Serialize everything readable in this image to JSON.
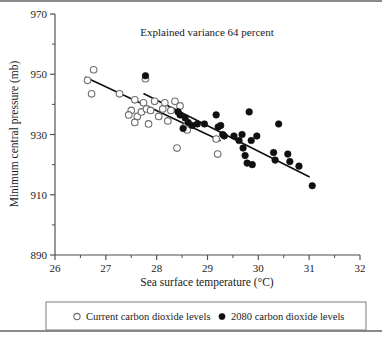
{
  "chart_data": {
    "type": "scatter",
    "title": "Explained variance 64 percent",
    "xlabel": "Sea surface temperature (°C)",
    "ylabel": "Minimum central pressure (mb)",
    "xlim": [
      26,
      32
    ],
    "ylim": [
      890,
      970
    ],
    "xticks": [
      26,
      27,
      28,
      29,
      30,
      31,
      32
    ],
    "yticks": [
      890,
      910,
      930,
      950,
      970
    ],
    "xtick_labels": [
      "26",
      "27",
      "28",
      "29",
      "30",
      "31",
      "32"
    ],
    "ytick_labels": [
      "890",
      "910",
      "930",
      "950",
      "970"
    ],
    "x_minor_step": 0.5,
    "y_minor_step": 10,
    "grid": false,
    "legend_position": "below-axes",
    "series": [
      {
        "name": "Current carbon dioxide levels",
        "marker": "open-circle",
        "color": "#ffffff",
        "edge_color": "#6f6f6f",
        "points": [
          [
            26.64,
            948.0
          ],
          [
            26.76,
            951.5
          ],
          [
            26.72,
            943.5
          ],
          [
            27.27,
            943.5
          ],
          [
            27.5,
            938.0
          ],
          [
            27.57,
            941.5
          ],
          [
            27.45,
            936.5
          ],
          [
            27.62,
            936.0
          ],
          [
            27.57,
            934.0
          ],
          [
            27.7,
            937.5
          ],
          [
            27.74,
            940.5
          ],
          [
            27.78,
            948.5
          ],
          [
            27.8,
            938.5
          ],
          [
            27.84,
            933.5
          ],
          [
            27.88,
            938.0
          ],
          [
            27.96,
            941.0
          ],
          [
            28.04,
            936.0
          ],
          [
            28.12,
            938.5
          ],
          [
            28.16,
            940.5
          ],
          [
            28.22,
            934.5
          ],
          [
            28.28,
            938.0
          ],
          [
            28.36,
            941.0
          ],
          [
            28.4,
            925.5
          ],
          [
            28.46,
            939.5
          ],
          [
            28.56,
            932.5
          ],
          [
            28.6,
            931.5
          ],
          [
            29.17,
            928.5
          ],
          [
            29.2,
            923.5
          ]
        ]
      },
      {
        "name": "2080 carbon dioxide levels",
        "marker": "filled-circle",
        "color": "#101010",
        "edge_color": "#101010",
        "points": [
          [
            27.78,
            949.5
          ],
          [
            28.42,
            937.5
          ],
          [
            28.46,
            936.5
          ],
          [
            28.56,
            935.5
          ],
          [
            28.52,
            932.0
          ],
          [
            28.62,
            934.0
          ],
          [
            28.7,
            933.0
          ],
          [
            28.8,
            933.5
          ],
          [
            28.94,
            933.5
          ],
          [
            29.17,
            936.5
          ],
          [
            29.21,
            932.5
          ],
          [
            29.26,
            933.0
          ],
          [
            29.3,
            930.0
          ],
          [
            29.33,
            929.5
          ],
          [
            29.52,
            929.5
          ],
          [
            29.62,
            928.0
          ],
          [
            29.68,
            930.0
          ],
          [
            29.7,
            925.5
          ],
          [
            29.74,
            923.0
          ],
          [
            29.78,
            920.5
          ],
          [
            29.82,
            937.5
          ],
          [
            29.86,
            928.0
          ],
          [
            29.88,
            920.0
          ],
          [
            29.97,
            929.5
          ],
          [
            30.3,
            924.0
          ],
          [
            30.33,
            921.5
          ],
          [
            30.4,
            933.5
          ],
          [
            30.58,
            923.5
          ],
          [
            30.62,
            921.0
          ],
          [
            30.8,
            919.5
          ],
          [
            31.06,
            913.0
          ]
        ]
      }
    ],
    "fit_lines": [
      {
        "name": "Current carbon dioxide levels fit",
        "x0": 26.6,
        "y0": 949.0,
        "x1": 29.25,
        "y1": 928.0
      },
      {
        "name": "2080 carbon dioxide levels fit",
        "x0": 27.75,
        "y0": 943.5,
        "x1": 31.0,
        "y1": 916.0
      }
    ]
  },
  "legend": {
    "entries": [
      {
        "marker": "open-circle",
        "label": "Current carbon dioxide levels"
      },
      {
        "marker": "filled-circle",
        "label": "2080 carbon dioxide levels"
      }
    ]
  }
}
